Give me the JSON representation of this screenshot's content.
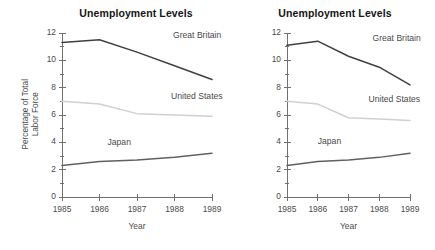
{
  "figure": {
    "panels": [
      {
        "id": "left",
        "title": "Unemployment Levels",
        "ylabel_line1": "Percentage of Total",
        "ylabel_line2": "Labor Force",
        "xlabel": "Year"
      },
      {
        "id": "right",
        "title": "Unemployment Levels",
        "ylabel_line1": "",
        "ylabel_line2": "",
        "xlabel": "Year"
      }
    ]
  },
  "chart_data": [
    {
      "type": "line",
      "title": "Unemployment Levels",
      "xlabel": "Year",
      "ylabel": "Percentage of Total Labor Force",
      "categories": [
        "1985",
        "1986",
        "1987",
        "1988",
        "1989"
      ],
      "x": [
        1985,
        1986,
        1987,
        1988,
        1989
      ],
      "xlim": [
        1985,
        1989
      ],
      "ylim": [
        0,
        12
      ],
      "yticks": [
        0,
        2,
        4,
        6,
        8,
        10,
        12
      ],
      "yticklabels": [
        "0",
        "2",
        "4",
        "6",
        "8",
        "10",
        "12"
      ],
      "minor_yticks": [
        1,
        3,
        5,
        7,
        9,
        11
      ],
      "xticks": [
        1985,
        1986,
        1987,
        1988,
        1989
      ],
      "xticklabels": [
        "1985",
        "1986",
        "1987",
        "1988",
        "1989"
      ],
      "grid": false,
      "legend": "inline-annotations",
      "series": [
        {
          "name": "Great Britain",
          "color": "#404040",
          "values": [
            11.3,
            11.5,
            10.6,
            9.6,
            8.6
          ]
        },
        {
          "name": "United States",
          "color": "#d0d0d0",
          "values": [
            7.0,
            6.8,
            6.1,
            6.0,
            5.9
          ]
        },
        {
          "name": "Japan",
          "color": "#606060",
          "values": [
            2.3,
            2.6,
            2.7,
            2.9,
            3.2
          ]
        }
      ]
    },
    {
      "type": "line",
      "title": "Unemployment Levels",
      "xlabel": "Year",
      "ylabel": "",
      "categories": [
        "1985",
        "1986",
        "1987",
        "1988",
        "1989"
      ],
      "x": [
        1985,
        1986,
        1987,
        1988,
        1989
      ],
      "xlim": [
        1985,
        1989
      ],
      "ylim": [
        0,
        12
      ],
      "yticks": [
        0,
        2,
        4,
        6,
        8,
        10,
        12
      ],
      "yticklabels": [
        "0",
        "2",
        "4",
        "6",
        "8",
        "10",
        "12"
      ],
      "minor_yticks": [
        1,
        3,
        5,
        7,
        9,
        11
      ],
      "xticks": [
        1985,
        1986,
        1987,
        1988,
        1989
      ],
      "xticklabels": [
        "1985",
        "1986",
        "1987",
        "1988",
        "1989"
      ],
      "grid": false,
      "legend": "inline-annotations",
      "series": [
        {
          "name": "Great Britain",
          "color": "#404040",
          "values": [
            11.1,
            11.4,
            10.3,
            9.5,
            8.2
          ]
        },
        {
          "name": "United States",
          "color": "#d0d0d0",
          "values": [
            7.0,
            6.8,
            5.8,
            5.7,
            5.6
          ]
        },
        {
          "name": "Japan",
          "color": "#606060",
          "values": [
            2.3,
            2.6,
            2.7,
            2.9,
            3.2
          ]
        }
      ]
    }
  ],
  "annotations": {
    "left": [
      {
        "series": "Great Britain",
        "text": "Great Britain"
      },
      {
        "series": "United States",
        "text": "United States"
      },
      {
        "series": "Japan",
        "text": "Japan"
      }
    ],
    "right": [
      {
        "series": "Great Britain",
        "text": "Great Britain"
      },
      {
        "series": "United States",
        "text": "United States"
      },
      {
        "series": "Japan",
        "text": "Japan"
      }
    ]
  },
  "style": {
    "axis_color": "#707070",
    "text_color": "#4a4a4a",
    "title_color": "#151515",
    "background": "#ffffff"
  }
}
